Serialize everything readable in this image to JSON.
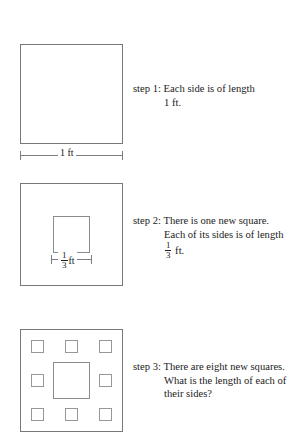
{
  "document": {
    "kind": "geometry-construction-figure",
    "topic": "Sierpinski carpet iterative square construction"
  },
  "colors": {
    "background": "#ffffff",
    "text": "#1c1c1c",
    "outline": "#77787a",
    "inner_outline": "#8a8b8d",
    "small_outline": "#96979a",
    "dimension_rule": "#7d7e80"
  },
  "steps": [
    {
      "id": "step-1",
      "label": "step 1:",
      "lines": [
        "step 1: Each side is of length",
        "1 ft."
      ],
      "line1": "step 1: Each side is of length",
      "line2": "1 ft.",
      "dimension": {
        "label": "1 ft",
        "value_numerator": "1",
        "unit": "ft"
      },
      "squares": 1
    },
    {
      "id": "step-2",
      "label": "step 2:",
      "line1": "step 2: There is one new square.",
      "line2": "Each of its sides is of length",
      "line3_fraction_numerator": "1",
      "line3_fraction_denominator": "3",
      "line3_unit": "ft.",
      "dimension": {
        "numerator": "1",
        "denominator": "3",
        "unit": "ft"
      },
      "squares": 1
    },
    {
      "id": "step-3",
      "label": "step 3:",
      "line1": "step 3: There are eight new squares.",
      "line2": "What is the length of each of",
      "line3": "their sides?",
      "squares": 8
    }
  ]
}
